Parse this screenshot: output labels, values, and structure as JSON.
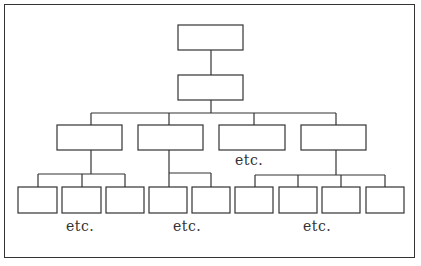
{
  "diagram": {
    "type": "organization-chart",
    "levels": [
      {
        "level": 1,
        "boxes": 1
      },
      {
        "level": 2,
        "boxes": 1
      },
      {
        "level": 3,
        "boxes": 4
      },
      {
        "level": 4,
        "boxes": 9
      }
    ],
    "labels": {
      "etc_level3": "etc.",
      "etc_group1": "etc.",
      "etc_group2": "etc.",
      "etc_group3": "etc."
    },
    "colors": {
      "line": "#333333",
      "background": "#ffffff"
    }
  }
}
